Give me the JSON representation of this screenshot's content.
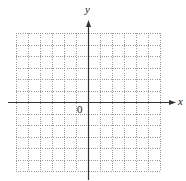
{
  "figure": {
    "type": "coordinate-plane",
    "axes": {
      "x_label": "x",
      "y_label": "y",
      "origin_label": "0"
    },
    "grid": {
      "columns": 12,
      "rows": 12,
      "left": 16,
      "right": 160,
      "top": 33,
      "bottom": 171,
      "style": "dotted",
      "color": "#9a9a9a"
    },
    "axis_geometry": {
      "origin_x": 88,
      "origin_y": 102,
      "x_axis_start": 8,
      "x_axis_end": 176,
      "y_axis_top": 20,
      "y_axis_bottom": 180,
      "color": "#333333"
    }
  }
}
